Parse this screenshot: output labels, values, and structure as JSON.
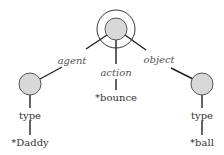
{
  "diagram": {
    "type": "semantic-network",
    "colors": {
      "node_fill": "#d8d8d8",
      "node_stroke": "#555555",
      "line": "#222222",
      "label": "#333333",
      "relation_label": "#555555"
    },
    "root": {
      "label": "",
      "ring": true
    },
    "relations": {
      "agent": "agent",
      "action": "action",
      "object": "object"
    },
    "left_branch": {
      "relation": "agent",
      "sub_relation": "type",
      "value": "*Daddy"
    },
    "middle_branch": {
      "relation": "action",
      "value": "*bounce"
    },
    "right_branch": {
      "relation": "object",
      "sub_relation": "type",
      "value": "*ball"
    }
  }
}
